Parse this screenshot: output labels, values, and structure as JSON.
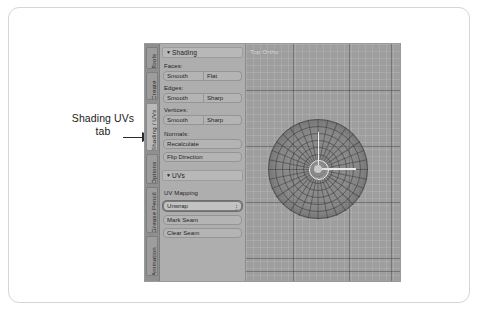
{
  "annotation": {
    "line1": "Shading UVs",
    "line2": "tab",
    "arrow_icon": "arrow-right-icon"
  },
  "blender": {
    "tab_strip": {
      "tabs": [
        {
          "label": "Tools",
          "active": false
        },
        {
          "label": "Create",
          "active": false
        },
        {
          "label": "Shading / UVs",
          "active": true
        },
        {
          "label": "Options",
          "active": false
        },
        {
          "label": "Grease Pencil",
          "active": false
        },
        {
          "label": "Animation",
          "active": false
        }
      ]
    },
    "panel": {
      "shading": {
        "title": "Shading",
        "collapse_icon": "triangle-down-icon",
        "groups": [
          {
            "label": "Faces:",
            "buttons": [
              "Smooth",
              "Flat"
            ]
          },
          {
            "label": "Edges:",
            "buttons": [
              "Smooth",
              "Sharp"
            ]
          },
          {
            "label": "Vertices:",
            "buttons": [
              "Smooth",
              "Sharp"
            ]
          }
        ],
        "normals_label": "Normals:",
        "normals_buttons": [
          "Recalculate",
          "Flip Direction"
        ]
      },
      "uvs": {
        "title": "UVs",
        "collapse_icon": "triangle-down-icon",
        "mapping_label": "UV Mapping",
        "mapping_value": "Unwrap",
        "mapping_caret": "chevron-updown-icon",
        "buttons": [
          "Mark Seam",
          "Clear Seam"
        ]
      }
    },
    "viewport": {
      "view_label": "Top Ortho",
      "object": "uv-sphere-radial-mesh",
      "gizmo": "transform-manipulator"
    }
  },
  "colors": {
    "frame_border": "#d6d6d6",
    "panel_bg": "#aeaeae",
    "tab_bg": "#8f8f8f",
    "tab_active": "#b9b9b9",
    "button_bg": "#b4b4b4",
    "viewport_bg": "#9e9e9e",
    "highlight_outline": "#6f6f6f"
  }
}
